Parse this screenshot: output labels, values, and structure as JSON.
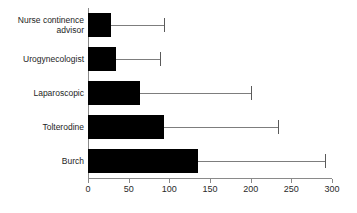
{
  "chart_data": {
    "type": "bar",
    "orientation": "horizontal",
    "title": "",
    "subtitle": "",
    "xlabel": "",
    "ylabel": "",
    "xlim": [
      0,
      300
    ],
    "grid": false,
    "legend": null,
    "xticks": [
      0,
      50,
      100,
      150,
      200,
      250,
      300
    ],
    "xtick_labels": [
      "0",
      "50",
      "100",
      "150",
      "200",
      "250",
      "300"
    ],
    "categories": [
      "Nurse continence\nadvisor",
      "Urogynecologist",
      "Laparoscopic",
      "Tolterodine",
      "Burch"
    ],
    "values": [
      28,
      34,
      64,
      94,
      135
    ],
    "error_upper": [
      93,
      88,
      200,
      234,
      292
    ],
    "series": [
      {
        "name": "value",
        "values": [
          28,
          34,
          64,
          94,
          135
        ],
        "error_upper": [
          93,
          88,
          200,
          234,
          292
        ]
      }
    ],
    "colors": {
      "bar": "#000000",
      "error": "#7d7d7d",
      "axis": "#8a8a8a",
      "text": "#1e1e1e",
      "background": "#ffffff"
    }
  }
}
